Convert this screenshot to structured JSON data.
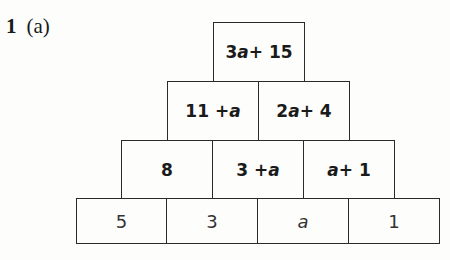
{
  "question": {
    "number": "1",
    "part": "(a)"
  },
  "pyramid": {
    "rows": [
      {
        "level": 1,
        "cells": [
          {
            "text": "3a + 15"
          }
        ]
      },
      {
        "level": 2,
        "cells": [
          {
            "text": "11 + a"
          },
          {
            "text": "2a + 4"
          }
        ]
      },
      {
        "level": 3,
        "cells": [
          {
            "text": "8"
          },
          {
            "text": "3 + a"
          },
          {
            "text": "a + 1"
          }
        ]
      },
      {
        "level": 4,
        "cells": [
          {
            "text": "5"
          },
          {
            "text": "3"
          },
          {
            "text": "a"
          },
          {
            "text": "1"
          }
        ]
      }
    ]
  }
}
